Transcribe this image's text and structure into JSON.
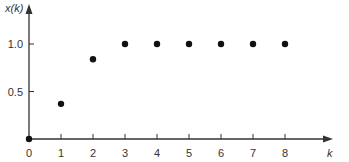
{
  "chart_data": {
    "type": "scatter",
    "title": "",
    "xlabel": "k",
    "ylabel": "x(k)",
    "x": [
      0,
      1,
      2,
      3,
      4,
      5,
      6,
      7,
      8
    ],
    "values": [
      0,
      0.37,
      0.84,
      1.0,
      1.0,
      1.0,
      1.0,
      1.0,
      1.0
    ],
    "x_ticks": [
      "0",
      "1",
      "2",
      "3",
      "4",
      "5",
      "6",
      "7",
      "8"
    ],
    "y_ticks": [
      "0.5",
      "1.0"
    ],
    "xlim": [
      0,
      9
    ],
    "ylim": [
      0,
      1.3
    ],
    "grid": false,
    "legend": null
  },
  "colors": {
    "axis": "#333333",
    "marker": "#111111"
  }
}
